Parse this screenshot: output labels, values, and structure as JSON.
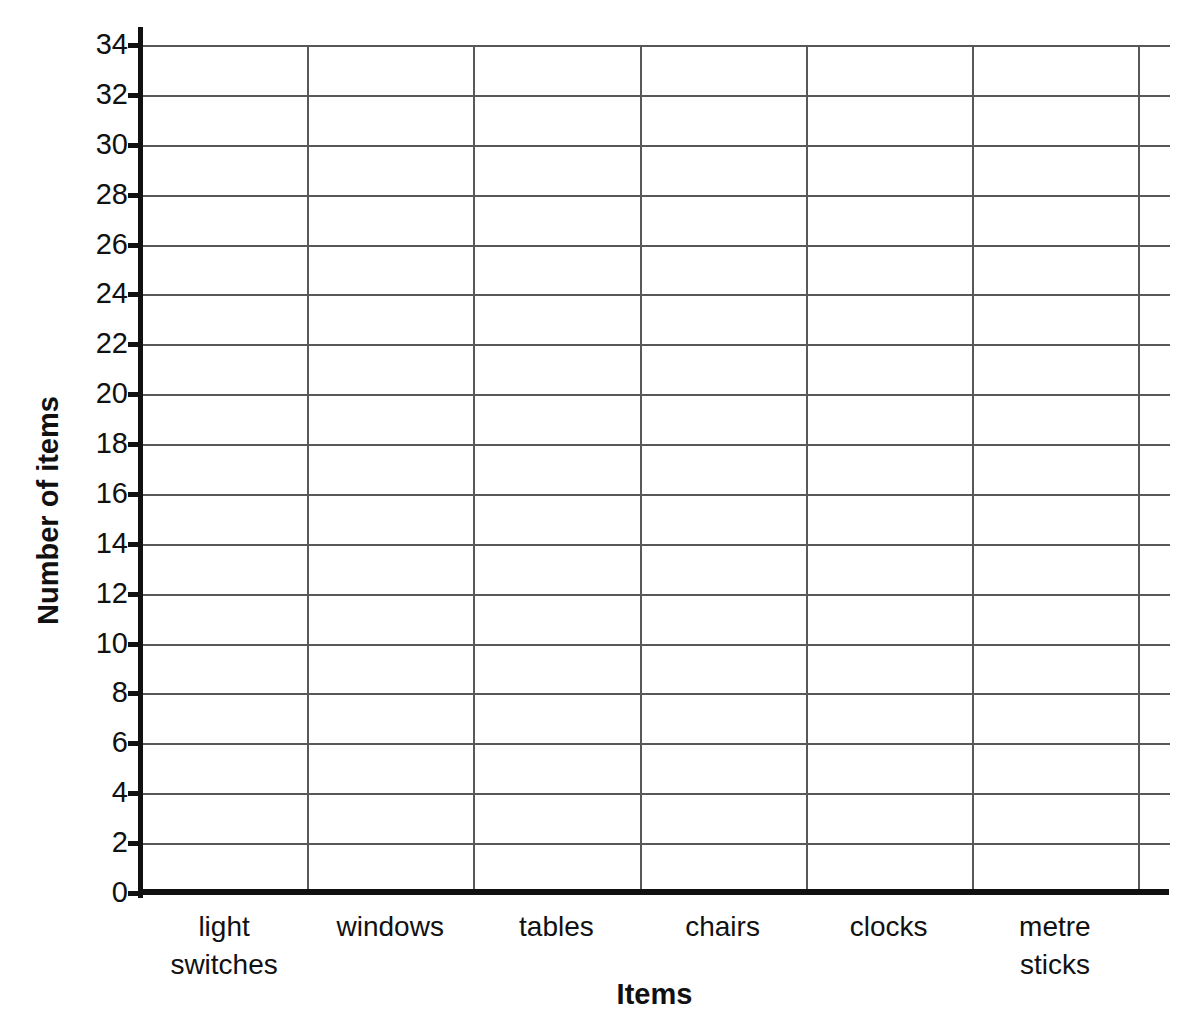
{
  "chart_data": {
    "type": "bar",
    "title": "",
    "subtitle": "",
    "xlabel": "Items",
    "ylabel": "Number of items",
    "categories": [
      "light switches",
      "windows",
      "tables",
      "chairs",
      "clocks",
      "metre sticks"
    ],
    "category_lines": [
      [
        "light",
        "switches"
      ],
      [
        "windows"
      ],
      [
        "tables"
      ],
      [
        "chairs"
      ],
      [
        "clocks"
      ],
      [
        "metre",
        "sticks"
      ]
    ],
    "values": [
      null,
      null,
      null,
      null,
      null,
      null
    ],
    "ylim": [
      0,
      34
    ],
    "ytick_step": 2,
    "ytick_labels": [
      "0",
      "2",
      "4",
      "6",
      "8",
      "10",
      "12",
      "14",
      "16",
      "18",
      "20",
      "22",
      "24",
      "26",
      "28",
      "30",
      "32",
      "34"
    ],
    "ytick_values": [
      0,
      2,
      4,
      6,
      8,
      10,
      12,
      14,
      16,
      18,
      20,
      22,
      24,
      26,
      28,
      30,
      32,
      34
    ],
    "grid": true,
    "grid_axis": "both",
    "legend": false,
    "legend_position": "none",
    "annotations": [],
    "note": "Blank bar-chart grid: axes and gridlines drawn, no bars plotted"
  },
  "style": {
    "background": "#ffffff",
    "axis_color": "#111111",
    "grid_color": "#58585a",
    "text_color": "#111111"
  }
}
